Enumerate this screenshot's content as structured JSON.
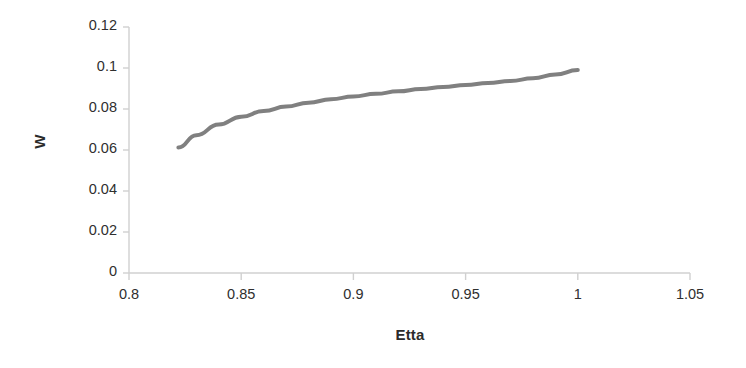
{
  "chart_data": {
    "type": "line",
    "title": "",
    "xlabel": "Etta",
    "ylabel": "W",
    "xlim": [
      0.8,
      1.05
    ],
    "ylim": [
      0,
      0.12
    ],
    "xticks": [
      "0.8",
      "0.85",
      "0.9",
      "0.95",
      "1",
      "1.05"
    ],
    "yticks": [
      "0",
      "0.02",
      "0.04",
      "0.06",
      "0.08",
      "0.1",
      "0.12"
    ],
    "grid": false,
    "legend": null,
    "series": [
      {
        "name": "W vs Etta",
        "color": "#808080",
        "x": [
          0.822,
          0.83,
          0.84,
          0.85,
          0.86,
          0.87,
          0.88,
          0.89,
          0.9,
          0.91,
          0.92,
          0.93,
          0.94,
          0.95,
          0.96,
          0.97,
          0.98,
          0.99,
          1.0
        ],
        "values": [
          0.0612,
          0.0672,
          0.0724,
          0.0762,
          0.079,
          0.0812,
          0.0831,
          0.0847,
          0.0861,
          0.0874,
          0.0886,
          0.0897,
          0.0907,
          0.0917,
          0.0927,
          0.0937,
          0.095,
          0.0968,
          0.099
        ]
      }
    ]
  },
  "axis": {
    "y_title": "W",
    "x_title": "Etta"
  },
  "style": {
    "line_color": "#808080",
    "axis_color": "#d0d0d0",
    "text_color": "#2b2b2b",
    "background": "#ffffff",
    "line_width": 4
  }
}
